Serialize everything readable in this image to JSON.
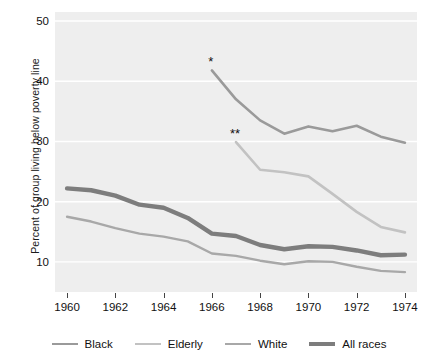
{
  "chart_data": {
    "type": "line",
    "title": "",
    "xlabel": "",
    "ylabel": "Percent of group living below poverty line",
    "xlim": [
      1959.5,
      1974.5
    ],
    "ylim": [
      5.0,
      51.5
    ],
    "grid": "horizontal",
    "legend_position": "bottom",
    "xticks": [
      "1960",
      "1962",
      "1964",
      "1966",
      "1968",
      "1970",
      "1972",
      "1974"
    ],
    "xtick_values": [
      1960,
      1962,
      1964,
      1966,
      1968,
      1970,
      1972,
      1974
    ],
    "yticks": [
      "10",
      "20",
      "30",
      "40",
      "50"
    ],
    "ytick_values": [
      10,
      20,
      30,
      40,
      50
    ],
    "series": [
      {
        "name": "Black",
        "color": "#9a9a9a",
        "width": 2.6,
        "marker_note": "*",
        "x": [
          1966,
          1967,
          1968,
          1969,
          1970,
          1971,
          1972,
          1973,
          1974
        ],
        "values": [
          41.8,
          37.0,
          33.5,
          31.3,
          32.5,
          31.7,
          32.6,
          30.8,
          29.8
        ]
      },
      {
        "name": "Elderly",
        "color": "#c2c2c2",
        "width": 2.6,
        "marker_note": "**",
        "x": [
          1967,
          1968,
          1969,
          1970,
          1971,
          1972,
          1973,
          1974
        ],
        "values": [
          29.9,
          25.3,
          24.9,
          24.2,
          21.3,
          18.3,
          15.8,
          14.9
        ]
      },
      {
        "name": "White",
        "color": "#a8a8a8",
        "width": 2.4,
        "x": [
          1960,
          1961,
          1962,
          1963,
          1964,
          1965,
          1966,
          1967,
          1968,
          1969,
          1970,
          1971,
          1972,
          1973,
          1974
        ],
        "values": [
          17.5,
          16.7,
          15.6,
          14.7,
          14.2,
          13.4,
          11.4,
          11.0,
          10.2,
          9.6,
          10.1,
          10.0,
          9.2,
          8.5,
          8.3
        ]
      },
      {
        "name": "All races",
        "color": "#7d7d7d",
        "width": 4.4,
        "x": [
          1960,
          1961,
          1962,
          1963,
          1964,
          1965,
          1966,
          1967,
          1968,
          1969,
          1970,
          1971,
          1972,
          1973,
          1974
        ],
        "values": [
          22.2,
          21.9,
          21.0,
          19.5,
          19.0,
          17.3,
          14.7,
          14.3,
          12.8,
          12.1,
          12.6,
          12.5,
          11.9,
          11.1,
          11.2
        ]
      }
    ],
    "annotations": [
      {
        "text": "*",
        "x": 1966,
        "y": 41.8,
        "series": "Black"
      },
      {
        "text": "**",
        "x": 1967,
        "y": 29.9,
        "series": "Elderly"
      }
    ]
  },
  "legend": {
    "items": [
      {
        "label": "Black",
        "color": "#9a9a9a",
        "thickness": "2.6px"
      },
      {
        "label": "Elderly",
        "color": "#c2c2c2",
        "thickness": "2.6px"
      },
      {
        "label": "White",
        "color": "#a8a8a8",
        "thickness": "2.4px"
      },
      {
        "label": "All races",
        "color": "#7d7d7d",
        "thickness": "4.4px"
      }
    ]
  },
  "axes": {
    "y_title": "Percent of group living below poverty line",
    "y_ticks": [
      "50",
      "40",
      "30",
      "20",
      "10"
    ],
    "x_ticks": [
      "1960",
      "1962",
      "1964",
      "1966",
      "1968",
      "1970",
      "1972",
      "1974"
    ]
  },
  "colors": {
    "panel_background": "#eeeeee",
    "gridline": "#ffffff",
    "text": "#111111"
  }
}
